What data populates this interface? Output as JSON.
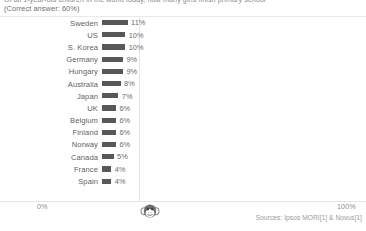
{
  "header": {
    "question_line": "Of all 1-year-old children in the world today, how many girls finish primary school",
    "correct_answer_line": "(Correct answer: 60%)"
  },
  "axis": {
    "min_label": "0%",
    "max_label": "100%"
  },
  "marker": {
    "icon_name": "chimp-icon"
  },
  "footer": {
    "sources": "Sources: Ipsos MORI[1] & Novus[1]"
  },
  "colors": {
    "bar": "#585858",
    "axis_line": "#e4e4e4",
    "label_text": "#5f5f5f",
    "value_text": "#6a6a6a"
  },
  "chart_data": {
    "type": "bar",
    "title": "Of all 1-year-old children in the world today, how many girls finish primary school",
    "subtitle": "(Correct answer: 60%)",
    "orientation": "horizontal",
    "xlabel": "",
    "ylabel": "",
    "xlim": [
      0,
      100
    ],
    "xtick_labels": [
      "0%",
      "100%"
    ],
    "grid": false,
    "legend": "none",
    "unit": "%",
    "annotation": "Chimp line marker at 33%",
    "categories": [
      "Sweden",
      "US",
      "S. Korea",
      "Germany",
      "Hungary",
      "Australia",
      "Japan",
      "UK",
      "Belgium",
      "Finland",
      "Norway",
      "Canada",
      "France",
      "Spain"
    ],
    "values": [
      11,
      10,
      10,
      9,
      9,
      8,
      7,
      6,
      6,
      6,
      6,
      5,
      4,
      4
    ],
    "value_labels": [
      "11%",
      "10%",
      "10%",
      "9%",
      "9%",
      "8%",
      "7%",
      "6%",
      "6%",
      "6%",
      "6%",
      "5%",
      "4%",
      "4%"
    ],
    "source": "Sources: Ipsos MORI[1] & Novus[1]"
  }
}
